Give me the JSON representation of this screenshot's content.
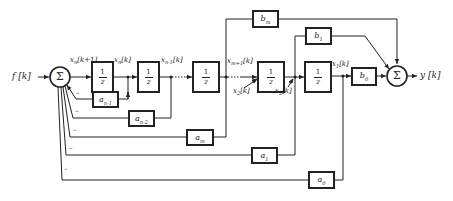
{
  "diagram": {
    "type": "block-diagram",
    "input_label": "f [k]",
    "output_label": "y [k]",
    "summers": [
      {
        "id": "sum-input",
        "symbol": "Σ"
      },
      {
        "id": "sum-output",
        "symbol": "Σ"
      }
    ],
    "delays": [
      {
        "id": "delay-n",
        "num": "1",
        "den": "z",
        "input_label": "x_n[k+1]",
        "output_label": "x_n[k]"
      },
      {
        "id": "delay-n-1",
        "num": "1",
        "den": "z",
        "output_label": "x_{n-1}[k]"
      },
      {
        "id": "delay-m+1",
        "num": "1",
        "den": "z",
        "output_label": "x_{m+1}[k]"
      },
      {
        "id": "delay-2",
        "num": "1",
        "den": "z",
        "input_label": "x_2[k]",
        "output_label": "x_2[k]"
      },
      {
        "id": "delay-1",
        "num": "1",
        "den": "z",
        "output_label": "x_1[k]"
      }
    ],
    "gains_feedforward": [
      {
        "id": "b_m",
        "label": "b",
        "sub": "m"
      },
      {
        "id": "b_1",
        "label": "b",
        "sub": "1"
      },
      {
        "id": "b_0",
        "label": "b",
        "sub": "0"
      }
    ],
    "gains_feedback": [
      {
        "id": "a_n-1",
        "label": "a",
        "sub": "n-1"
      },
      {
        "id": "a_n-2",
        "label": "a",
        "sub": "n-2"
      },
      {
        "id": "a_m",
        "label": "a",
        "sub": "m"
      },
      {
        "id": "a_1",
        "label": "a",
        "sub": "1"
      },
      {
        "id": "a_0",
        "label": "a",
        "sub": "0"
      }
    ],
    "signal_labels": {
      "xn_next": "x",
      "xn_next_sub": "n",
      "xn_next_tail": "[k+1]",
      "xn": "x",
      "xn_sub": "n",
      "xn_tail": "[k]",
      "xn1": "x",
      "xn1_sub": "n-1",
      "xn1_tail": "[k]",
      "xm1": "x",
      "xm1_sub": "m+1",
      "xm1_tail": "[k]",
      "x2a": "x",
      "x2a_sub": "2",
      "x2a_tail": "[k]",
      "x2b": "x",
      "x2b_sub": "2",
      "x2b_tail": "[k]",
      "x1": "x",
      "x1_sub": "1",
      "x1_tail": "[k]"
    },
    "feedback_sign": "–"
  }
}
